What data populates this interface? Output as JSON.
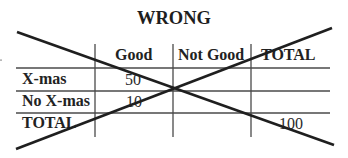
{
  "title": "WRONG",
  "table": {
    "columns": [
      "",
      "Good",
      "Not Good",
      "TOTAL"
    ],
    "rows": [
      {
        "label": "X-mas",
        "cells": [
          "50",
          "",
          ""
        ]
      },
      {
        "label": "No X-mas",
        "cells": [
          "10",
          "",
          ""
        ]
      },
      {
        "label": "TOTAL",
        "cells": [
          "",
          "",
          "100"
        ]
      }
    ]
  },
  "overlay": {
    "icon": "x-cross-icon",
    "meaning": "crossed-out"
  },
  "colors": {
    "background": "#ffffff",
    "text": "#222222",
    "grid": "#4a4a4a",
    "cross": "#1f1f1f"
  }
}
